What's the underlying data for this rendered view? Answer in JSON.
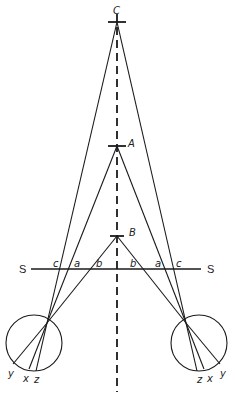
{
  "diagram": {
    "type": "binocular stereopsis geometry",
    "axis": {
      "style": "dashed",
      "x": 117
    },
    "points": [
      {
        "id": "C",
        "label": "C",
        "x": 117,
        "y": 22
      },
      {
        "id": "A",
        "label": "A",
        "x": 117,
        "y": 146
      },
      {
        "id": "B",
        "label": "B",
        "x": 117,
        "y": 236
      }
    ],
    "plane": {
      "label_left": "S",
      "label_right": "S",
      "y": 269
    },
    "intersection_labels_left": [
      "c",
      "a",
      "b"
    ],
    "intersection_labels_right": [
      "b",
      "a",
      "c"
    ],
    "eyes": [
      {
        "id": "left-eye",
        "retina_labels": [
          "y",
          "x",
          "z"
        ]
      },
      {
        "id": "right-eye",
        "retina_labels": [
          "z",
          "x",
          "y"
        ]
      }
    ]
  }
}
